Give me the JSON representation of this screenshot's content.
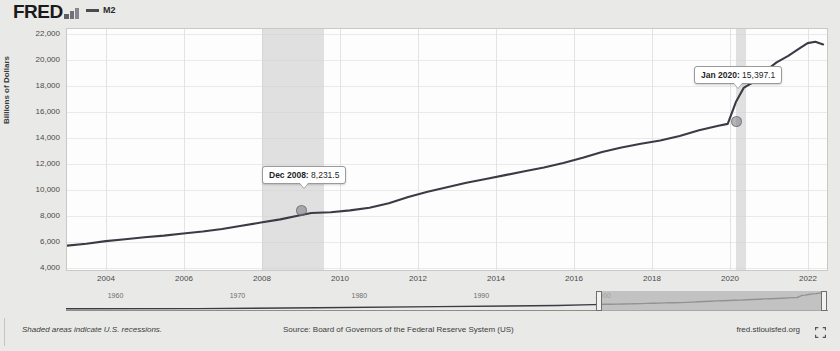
{
  "header": {
    "logo_text": "FRED",
    "logo_icon": "bar-chart-icon",
    "legend_series_label": "M2",
    "legend_color": "#4a4a52"
  },
  "footer": {
    "recession_note": "Shaded areas indicate U.S. recessions.",
    "source": "Source: Board of Governors of the Federal Reserve System (US)",
    "url": "fred.stlouisfed.org",
    "expand_icon": "expand-fullscreen-icon"
  },
  "minimap": {
    "ticks": [
      "1960",
      "1970",
      "1980",
      "1990",
      "2000"
    ],
    "tick_positions_pct": [
      6.5,
      22.5,
      38.5,
      54.5,
      70.5
    ],
    "selection_start_pct": 70.0,
    "selection_end_pct": 99.5,
    "left_handle_label": "range-start-handle",
    "right_handle_label": "range-end-handle"
  },
  "annotations": [
    {
      "name": "annotation-dec-2008",
      "date_label": "Dec 2008:",
      "value_label": " 8,231.5",
      "date": "2008-12",
      "value": 8231.5,
      "box_left_px": 262,
      "box_top_px": 166,
      "marker_left_px": 300,
      "marker_top_px": 207
    },
    {
      "name": "annotation-jan-2020",
      "date_label": "Jan 2020:",
      "value_label": " 15,397.1",
      "date": "2020-01",
      "value": 15397.1,
      "box_left_px": 694,
      "box_top_px": 66,
      "marker_left_px": 735,
      "marker_top_px": 118
    }
  ],
  "chart_data": {
    "type": "line",
    "title": "",
    "xlabel": "",
    "ylabel": "Billions of Dollars",
    "series_name": "M2",
    "line_color": "#3b3b45",
    "grid": true,
    "legend_position": "top-left",
    "xlim": [
      2003.0,
      2022.6
    ],
    "ylim": [
      4000,
      22800
    ],
    "y_ticks": [
      4000,
      6000,
      8000,
      10000,
      12000,
      14000,
      16000,
      18000,
      20000,
      22000
    ],
    "y_tick_labels": [
      "4,000",
      "6,000",
      "8,000",
      "10,000",
      "12,000",
      "14,000",
      "16,000",
      "18,000",
      "20,000",
      "22,000"
    ],
    "x_ticks": [
      2004,
      2006,
      2008,
      2010,
      2012,
      2014,
      2016,
      2018,
      2020,
      2022
    ],
    "x_tick_labels": [
      "2004",
      "2006",
      "2008",
      "2010",
      "2012",
      "2014",
      "2016",
      "2018",
      "2020",
      "2022"
    ],
    "recession_bands": [
      {
        "start": 2007.92,
        "end": 2009.5,
        "label": "2008-2009 recession"
      },
      {
        "start": 2020.08,
        "end": 2020.33,
        "label": "2020 recession"
      }
    ],
    "x": [
      2003.0,
      2003.5,
      2004.0,
      2004.5,
      2005.0,
      2005.5,
      2006.0,
      2006.5,
      2007.0,
      2007.5,
      2008.0,
      2008.5,
      2008.95,
      2009.3,
      2009.8,
      2010.3,
      2010.8,
      2011.3,
      2011.8,
      2012.3,
      2012.8,
      2013.3,
      2013.8,
      2014.3,
      2014.8,
      2015.3,
      2015.8,
      2016.3,
      2016.8,
      2017.3,
      2017.8,
      2018.3,
      2018.8,
      2019.3,
      2019.8,
      2020.04,
      2020.25,
      2020.45,
      2020.7,
      2021.0,
      2021.3,
      2021.6,
      2021.9,
      2022.1,
      2022.3,
      2022.5
    ],
    "y": [
      5900,
      6050,
      6250,
      6400,
      6550,
      6680,
      6850,
      7000,
      7200,
      7450,
      7700,
      7950,
      8231.5,
      8450,
      8500,
      8650,
      8850,
      9200,
      9700,
      10100,
      10450,
      10800,
      11100,
      11400,
      11700,
      12000,
      12350,
      12750,
      13200,
      13550,
      13850,
      14100,
      14450,
      14900,
      15250,
      15397.1,
      17100,
      18200,
      18650,
      19500,
      20200,
      20700,
      21300,
      21700,
      21800,
      21600
    ]
  }
}
